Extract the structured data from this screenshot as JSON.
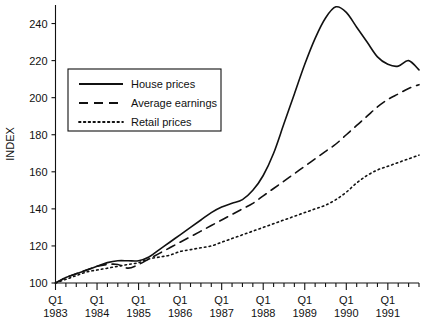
{
  "chart_data": {
    "type": "line",
    "title": "",
    "subtitle": "",
    "xlabel": "",
    "ylabel": "INDEX",
    "ylim": [
      100,
      250
    ],
    "xlim": [
      1983.0,
      1991.75
    ],
    "grid": false,
    "legend_position": "upper-left-inside",
    "y_ticks": [
      100,
      120,
      140,
      160,
      180,
      200,
      220,
      240
    ],
    "y_tick_labels": [
      "100",
      "120",
      "140",
      "160",
      "180",
      "200",
      "220",
      "240"
    ],
    "x_major_ticks": [
      1983.0,
      1984.0,
      1985.0,
      1986.0,
      1987.0,
      1988.0,
      1989.0,
      1990.0,
      1991.0
    ],
    "x_major_tick_labels": [
      {
        "quarter": "Q1",
        "year": "1983"
      },
      {
        "quarter": "Q1",
        "year": "1984"
      },
      {
        "quarter": "Q1",
        "year": "1985"
      },
      {
        "quarter": "Q1",
        "year": "1986"
      },
      {
        "quarter": "Q1",
        "year": "1987"
      },
      {
        "quarter": "Q1",
        "year": "1988"
      },
      {
        "quarter": "Q1",
        "year": "1989"
      },
      {
        "quarter": "Q1",
        "year": "1990"
      },
      {
        "quarter": "Q1",
        "year": "1991"
      }
    ],
    "x_minor_tick_interval_quarters": 1,
    "x": [
      1983.0,
      1983.25,
      1983.5,
      1983.75,
      1984.0,
      1984.25,
      1984.5,
      1984.75,
      1985.0,
      1985.25,
      1985.5,
      1985.75,
      1986.0,
      1986.25,
      1986.5,
      1986.75,
      1987.0,
      1987.25,
      1987.5,
      1987.75,
      1988.0,
      1988.25,
      1988.5,
      1988.75,
      1989.0,
      1989.25,
      1989.5,
      1989.75,
      1990.0,
      1990.25,
      1990.5,
      1990.75,
      1991.0,
      1991.25,
      1991.5,
      1991.75
    ],
    "series": [
      {
        "name": "House prices",
        "style": "solid",
        "color": "#111111",
        "values": [
          100,
          103,
          105,
          107,
          109,
          111,
          112,
          112,
          112,
          114,
          118,
          122,
          126,
          130,
          134,
          138,
          141,
          143,
          145,
          150,
          158,
          170,
          186,
          202,
          218,
          232,
          243,
          249,
          246,
          238,
          230,
          222,
          218,
          217,
          220,
          215
        ]
      },
      {
        "name": "Average earnings",
        "style": "dashed",
        "color": "#111111",
        "values": [
          100,
          103,
          105,
          107,
          109,
          110,
          110,
          108,
          110,
          113,
          116,
          119,
          122,
          125,
          128,
          131,
          134,
          137,
          140,
          143,
          147,
          151,
          155,
          159,
          163,
          167,
          171,
          175,
          180,
          185,
          190,
          195,
          199,
          202,
          205,
          207
        ]
      },
      {
        "name": "Retail prices",
        "style": "dotted",
        "color": "#111111",
        "values": [
          100,
          102,
          104,
          106,
          107,
          108,
          109,
          110,
          111,
          113,
          114,
          115,
          117,
          118,
          119,
          120,
          122,
          124,
          126,
          128,
          130,
          132,
          134,
          136,
          138,
          140,
          142,
          145,
          149,
          154,
          158,
          161,
          163,
          165,
          167,
          169
        ]
      }
    ]
  },
  "legend": {
    "entries": [
      {
        "label": "House prices",
        "style": "solid"
      },
      {
        "label": "Average earnings",
        "style": "dashed"
      },
      {
        "label": "Retail prices",
        "style": "dotted"
      }
    ]
  },
  "axis": {
    "y_title": "INDEX"
  }
}
